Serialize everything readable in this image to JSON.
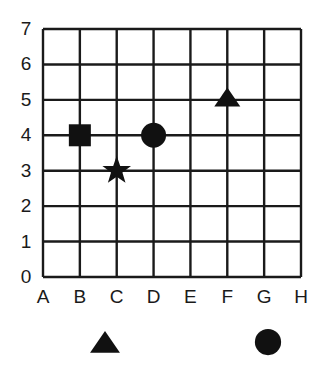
{
  "grid": {
    "x_labels": [
      "A",
      "B",
      "C",
      "D",
      "E",
      "F",
      "G",
      "H"
    ],
    "y_labels": [
      "0",
      "1",
      "2",
      "3",
      "4",
      "5",
      "6",
      "7"
    ],
    "line_color": "#1a1a1a"
  },
  "points": [
    {
      "shape": "square",
      "col": "B",
      "row": 4,
      "name": "square-marker"
    },
    {
      "shape": "star",
      "col": "C",
      "row": 3,
      "name": "star-marker"
    },
    {
      "shape": "circle",
      "col": "D",
      "row": 4,
      "name": "circle-marker"
    },
    {
      "shape": "triangle",
      "col": "F",
      "row": 5,
      "name": "triangle-marker"
    }
  ],
  "answer_options": [
    {
      "shape": "triangle",
      "name": "option-triangle"
    },
    {
      "shape": "circle",
      "name": "option-circle"
    }
  ],
  "chart_data": {
    "type": "scatter",
    "title": "",
    "xlabel": "",
    "ylabel": "",
    "categories": [
      "A",
      "B",
      "C",
      "D",
      "E",
      "F",
      "G",
      "H"
    ],
    "ylim": [
      0,
      7
    ],
    "grid": true,
    "series": [
      {
        "name": "square",
        "x": [
          "B"
        ],
        "y": [
          4
        ]
      },
      {
        "name": "star",
        "x": [
          "C"
        ],
        "y": [
          3
        ]
      },
      {
        "name": "circle",
        "x": [
          "D"
        ],
        "y": [
          4
        ]
      },
      {
        "name": "triangle",
        "x": [
          "F"
        ],
        "y": [
          5
        ]
      }
    ]
  }
}
